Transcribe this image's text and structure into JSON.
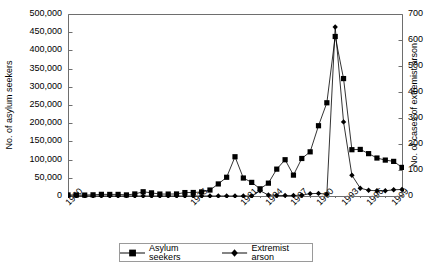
{
  "chart_data": {
    "type": "line",
    "title": "",
    "xlabel": "",
    "ylabel": "No. of asylum seekers",
    "ylabel_secondary": "No. of cases of extremist arson",
    "grid": false,
    "legend_position": "bottom",
    "xlim": [
      1960,
      2000
    ],
    "ylim": [
      0,
      500000
    ],
    "ylim_secondary": [
      0,
      700
    ],
    "x": [
      1960,
      1961,
      1962,
      1963,
      1964,
      1965,
      1966,
      1967,
      1968,
      1969,
      1970,
      1971,
      1972,
      1973,
      1974,
      1975,
      1976,
      1977,
      1978,
      1979,
      1980,
      1981,
      1982,
      1983,
      1984,
      1985,
      1986,
      1987,
      1988,
      1989,
      1990,
      1991,
      1992,
      1993,
      1994,
      1995,
      1996,
      1997,
      1998,
      1999,
      2000
    ],
    "xtick_labels": [
      "1960",
      "1975",
      "1981",
      "1984",
      "1987",
      "1990",
      "1993",
      "1996",
      "1999"
    ],
    "xtick_values": [
      1960,
      1975,
      1981,
      1984,
      1987,
      1990,
      1993,
      1996,
      1999
    ],
    "ytick_labels": [
      "0",
      "50,000",
      "100,000",
      "150,000",
      "200,000",
      "250,000",
      "300,000",
      "350,000",
      "400,000",
      "450,000",
      "500,000"
    ],
    "ytick_values": [
      0,
      50000,
      100000,
      150000,
      200000,
      250000,
      300000,
      350000,
      400000,
      450000,
      500000
    ],
    "ytick_labels_secondary": [
      "0",
      "100",
      "200",
      "300",
      "400",
      "500",
      "600",
      "700"
    ],
    "ytick_values_secondary": [
      0,
      100,
      200,
      300,
      400,
      500,
      600,
      700
    ],
    "series": [
      {
        "name": "Asylum seekers",
        "axis": "left",
        "marker": "square",
        "color": "#000000",
        "values": [
          2980,
          2722,
          2550,
          3238,
          4542,
          4337,
          4370,
          2992,
          5608,
          11664,
          8645,
          5388,
          5289,
          5595,
          9424,
          9627,
          11123,
          16410,
          33136,
          51493,
          107818,
          49391,
          37423,
          19737,
          35278,
          73832,
          99650,
          57379,
          103076,
          121318,
          193063,
          256112,
          438191,
          322599,
          127210,
          127937,
          116367,
          104353,
          98644,
          95113,
          78564
        ]
      },
      {
        "name": "Extremist arson",
        "axis": "right",
        "marker": "diamond",
        "color": "#000000",
        "values": [
          0,
          0,
          0,
          0,
          0,
          0,
          0,
          0,
          0,
          0,
          0,
          0,
          0,
          0,
          0,
          0,
          0,
          0,
          0,
          0,
          0,
          0,
          0,
          20,
          4,
          2,
          2,
          2,
          3,
          9,
          10,
          7,
          650,
          285,
          80,
          30,
          22,
          20,
          20,
          24,
          25
        ]
      }
    ]
  },
  "legend": {
    "entries": [
      {
        "label": "Asylum seekers",
        "marker": "square-marker-icon"
      },
      {
        "label": "Extremist arson",
        "marker": "diamond-marker-icon"
      }
    ]
  }
}
